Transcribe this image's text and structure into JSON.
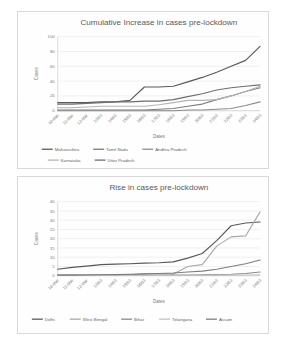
{
  "document": {
    "kind": "scanned-figure-page",
    "background": "#ffffff"
  },
  "charts": [
    {
      "id": "chart-1",
      "title": "Cumulative Increase in cases pre-lockdown",
      "xlabel": "Dates",
      "ylabel": "Cases",
      "legend_position": "bottom",
      "grid": true
    },
    {
      "id": "chart-2",
      "title": "Rise in cases pre-lockdown",
      "xlabel": "Dates",
      "ylabel": "Cases",
      "legend_position": "bottom",
      "grid": true
    }
  ],
  "chart_data": [
    {
      "type": "line",
      "title": "Cumulative Increase in cases pre-lockdown",
      "xlabel": "Dates",
      "ylabel": "Cases",
      "grid": true,
      "legend_position": "bottom",
      "ylim": [
        0,
        100
      ],
      "yticks": [
        0,
        20,
        40,
        60,
        80,
        100
      ],
      "categories": [
        "10-Mar",
        "11-Mar",
        "12-Mar",
        "13/03",
        "14/03",
        "15/03",
        "16/03",
        "17/03",
        "18/03",
        "19/03",
        "20/03",
        "21/03",
        "22/03",
        "23/03",
        "24/03"
      ],
      "series": [
        {
          "name": "Maharashtra",
          "color": "#595959",
          "values": [
            11,
            11,
            11,
            12,
            12,
            14,
            32,
            32,
            33,
            39,
            45,
            52,
            60,
            68,
            87
          ]
        },
        {
          "name": "Tamil Nadu",
          "color": "#7b7b7b",
          "values": [
            1,
            1,
            1,
            1,
            1,
            1,
            1,
            2,
            3,
            6,
            9,
            15,
            20,
            26,
            31
          ]
        },
        {
          "name": "Andhra Pradesh",
          "color": "#8c8c8c",
          "values": [
            0,
            0,
            0,
            0,
            0,
            0,
            0,
            0,
            0,
            1,
            1,
            2,
            3,
            7,
            12
          ]
        },
        {
          "name": "Karnataka",
          "color": "#b4b4b4",
          "values": [
            4,
            4,
            5,
            6,
            6,
            6,
            6,
            8,
            11,
            14,
            14,
            15,
            20,
            26,
            33
          ]
        },
        {
          "name": "Uttar Pradesh",
          "color": "#6e6e6e",
          "values": [
            9,
            9,
            10,
            11,
            12,
            12,
            13,
            13,
            15,
            19,
            23,
            28,
            31,
            33,
            35
          ]
        }
      ]
    },
    {
      "type": "line",
      "title": "Rise in cases pre-lockdown",
      "xlabel": "Dates",
      "ylabel": "Cases",
      "grid": true,
      "legend_position": "bottom",
      "ylim": [
        0,
        40
      ],
      "yticks": [
        0,
        5,
        10,
        15,
        20,
        25,
        30,
        35,
        40
      ],
      "categories": [
        "10-Mar",
        "11-Mar",
        "12-Mar",
        "13/03",
        "14/03",
        "15/03",
        "16/03",
        "17/03",
        "18/03",
        "19/03",
        "20/03",
        "21/03",
        "22/03",
        "23/03",
        "24/03"
      ],
      "series": [
        {
          "name": "Delhi",
          "color": "#595959",
          "values": [
            3.5,
            4.5,
            5.2,
            6,
            6.3,
            6.5,
            6.8,
            7,
            7.5,
            9.5,
            12,
            19,
            27,
            28.5,
            29
          ]
        },
        {
          "name": "West Bengal",
          "color": "#a8a8a8",
          "values": [
            0.5,
            0.5,
            0.5,
            0.5,
            0.5,
            0.5,
            1,
            1,
            1,
            5,
            6,
            16,
            21,
            21.5,
            34.5
          ]
        },
        {
          "name": "Bihar",
          "color": "#8a8a8a",
          "values": [
            0.2,
            0.2,
            0.2,
            0.2,
            0.2,
            0.2,
            0.2,
            0.2,
            0.3,
            0.4,
            0.5,
            0.6,
            0.8,
            1.2,
            2
          ]
        },
        {
          "name": "Telangana",
          "color": "#c2c2c2",
          "values": [
            0.1,
            0.1,
            0.1,
            0.1,
            0.1,
            0.1,
            0.1,
            0.1,
            0.1,
            0.2,
            0.2,
            0.3,
            0.3,
            0.4,
            0.5
          ]
        },
        {
          "name": "Assam",
          "color": "#7d7d7d",
          "values": [
            0.3,
            0.3,
            0.4,
            0.5,
            0.6,
            0.8,
            1,
            1.2,
            1.5,
            2,
            2.5,
            3.5,
            5,
            6.5,
            8.5
          ]
        }
      ]
    }
  ]
}
